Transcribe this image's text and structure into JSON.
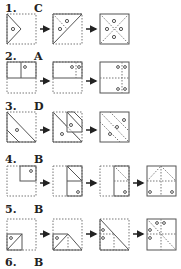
{
  "problems": [
    {
      "number": "1.",
      "answer": "C"
    },
    {
      "number": "2.",
      "answer": "A"
    },
    {
      "number": "3.",
      "answer": "D"
    },
    {
      "number": "4.",
      "answer": "B"
    },
    {
      "number": "5.",
      "answer": "B"
    },
    {
      "number": "6.",
      "answer": "B"
    }
  ],
  "icons": {
    "arrow": "right-arrow-icon",
    "hole": "punched-hole-circle"
  },
  "colors": {
    "solid_line": "#555555",
    "dotted_line": "#777777",
    "text": "#222222"
  }
}
